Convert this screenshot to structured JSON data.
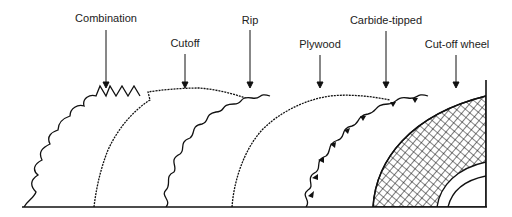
{
  "diagram": {
    "labels": [
      {
        "id": "combination",
        "text": "Combination",
        "x": 106,
        "y": 12,
        "arrow_x": 106,
        "arrow_y1": 30,
        "arrow_y2": 86
      },
      {
        "id": "cutoff",
        "text": "Cutoff",
        "x": 185,
        "y": 37,
        "arrow_x": 185,
        "arrow_y1": 54,
        "arrow_y2": 86
      },
      {
        "id": "rip",
        "text": "Rip",
        "x": 250,
        "y": 14,
        "arrow_x": 250,
        "arrow_y1": 30,
        "arrow_y2": 86
      },
      {
        "id": "plywood",
        "text": "Plywood",
        "x": 320,
        "y": 38,
        "arrow_x": 320,
        "arrow_y1": 55,
        "arrow_y2": 86
      },
      {
        "id": "carbide",
        "text": "Carbide-tipped",
        "x": 386,
        "y": 14,
        "arrow_x": 386,
        "arrow_y1": 31,
        "arrow_y2": 86
      },
      {
        "id": "cutoff-wheel",
        "text": "Cut-off wheel",
        "x": 457,
        "y": 38,
        "arrow_x": 456,
        "arrow_y1": 55,
        "arrow_y2": 86
      }
    ],
    "colors": {
      "line": "#111111",
      "background": "#ffffff"
    }
  }
}
